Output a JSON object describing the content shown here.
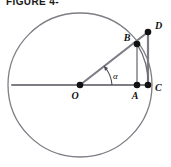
{
  "caption": {
    "text": "FIGURE 4-"
  },
  "colors": {
    "background": "#ffffff",
    "stroke": "#7d7d86",
    "stroke_dark": "#4a4a52",
    "point_fill": "#111111",
    "label_fill": "#111111"
  },
  "figure": {
    "circle": {
      "label": "circle",
      "center_x": 80,
      "center_y": 85,
      "radius": 72
    },
    "points": [
      {
        "id": "O",
        "label": "O",
        "x": 80,
        "y": 85,
        "label_x": 75,
        "label_y": 98,
        "role": "center"
      },
      {
        "id": "A",
        "label": "A",
        "x": 137,
        "y": 85,
        "label_x": 132,
        "label_y": 98,
        "role": "foot-of-perpendicular"
      },
      {
        "id": "C",
        "label": "C",
        "x": 148,
        "y": 85,
        "label_x": 154,
        "label_y": 92,
        "role": "on-circle-right"
      },
      {
        "id": "B",
        "label": "B",
        "x": 137,
        "y": 44,
        "label_x": 124,
        "label_y": 44,
        "role": "on-circle-radius"
      },
      {
        "id": "D",
        "label": "D",
        "x": 148,
        "y": 32,
        "label_x": 154,
        "label_y": 32,
        "role": "tangent-intersection"
      }
    ],
    "segments": [
      {
        "id": "diameter",
        "label": "O to C horizontal diameter",
        "x1": 12,
        "y1": 85,
        "x2": 148,
        "y2": 85,
        "weight": 2.2
      },
      {
        "id": "radius-to-D",
        "label": "O through B to D",
        "x1": 80,
        "y1": 85,
        "x2": 148,
        "y2": 32,
        "weight": 2.2
      },
      {
        "id": "BA",
        "label": "B perpendicular to A",
        "x1": 137,
        "y1": 44,
        "x2": 137,
        "y2": 85,
        "weight": 1.6
      },
      {
        "id": "DC",
        "label": "D tangent down to C",
        "x1": 148,
        "y1": 32,
        "x2": 148,
        "y2": 85,
        "weight": 2.2
      }
    ],
    "arcs": [
      {
        "id": "arc-BC",
        "label": "arc from B to C",
        "x1": 137,
        "y1": 44,
        "x2": 148,
        "y2": 85,
        "rx": 72,
        "ry": 72
      },
      {
        "id": "angle-arc",
        "label": "alpha angle marker",
        "cx": 80,
        "cy": 85,
        "r": 32
      }
    ],
    "angle": {
      "symbol": "α",
      "label_x": 115,
      "label_y": 78,
      "vertex": "O",
      "degrees": 38
    }
  }
}
